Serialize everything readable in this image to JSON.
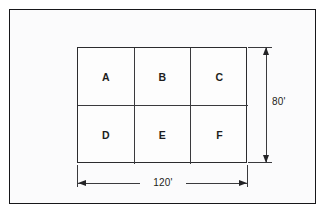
{
  "diagram": {
    "frame": {
      "border_color": "#17171a",
      "background_color": "#fbfbfc"
    },
    "grid": {
      "rows": 2,
      "columns": 3,
      "line_color": "#3a3a3d",
      "cells": [
        {
          "label": "A",
          "row": 1,
          "column": 1
        },
        {
          "label": "B",
          "row": 1,
          "column": 2
        },
        {
          "label": "C",
          "row": 1,
          "column": 3
        },
        {
          "label": "D",
          "row": 2,
          "column": 1
        },
        {
          "label": "E",
          "row": 2,
          "column": 2
        },
        {
          "label": "F",
          "row": 2,
          "column": 3
        }
      ]
    },
    "dimensions": {
      "width": {
        "label": "120'",
        "orientation": "horizontal",
        "position": "bottom"
      },
      "height": {
        "label": "80'",
        "orientation": "vertical",
        "position": "right"
      }
    }
  }
}
